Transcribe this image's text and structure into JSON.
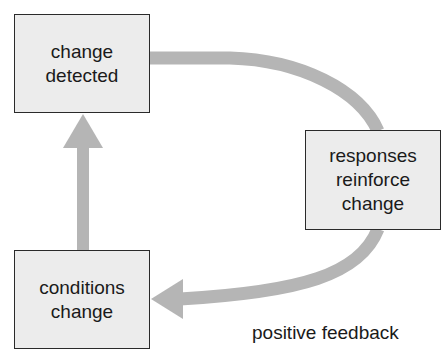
{
  "diagram": {
    "type": "feedback-loop",
    "nodes": [
      {
        "id": "change-detected",
        "lines": [
          "change",
          "detected"
        ]
      },
      {
        "id": "responses-reinforce-change",
        "lines": [
          "responses",
          "reinforce",
          "change"
        ]
      },
      {
        "id": "conditions-change",
        "lines": [
          "conditions",
          "change"
        ]
      }
    ],
    "edges": [
      {
        "from": "change-detected",
        "to": "responses-reinforce-change",
        "style": "curved"
      },
      {
        "from": "responses-reinforce-change",
        "to": "conditions-change",
        "style": "curved-arrow"
      },
      {
        "from": "conditions-change",
        "to": "change-detected",
        "style": "straight-arrow"
      }
    ],
    "caption": "positive feedback",
    "colors": {
      "arrow": "#b5b5b5",
      "box_fill": "#ececec",
      "box_border": "#2a2a2a",
      "text": "#1a1a1a"
    }
  }
}
